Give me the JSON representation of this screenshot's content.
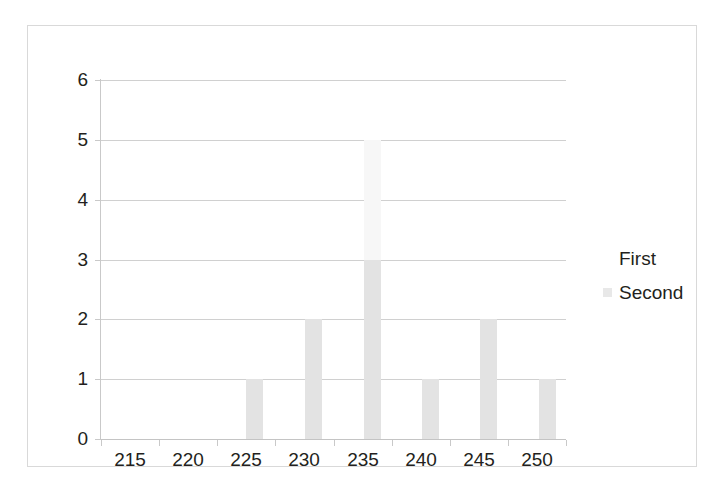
{
  "chart_data": {
    "type": "bar",
    "title": "",
    "subtitle": "",
    "xlabel": "",
    "ylabel": "",
    "xtick_labels": [
      "215",
      "220",
      "225",
      "230",
      "235",
      "240",
      "245",
      "250"
    ],
    "ytick_labels": [
      "0",
      "1",
      "2",
      "3",
      "4",
      "5",
      "6"
    ],
    "ylim": [
      0,
      6
    ],
    "xlim": [
      212.5,
      252.5
    ],
    "grid": true,
    "legend_position": "right",
    "legend": [
      {
        "name": "First",
        "color": "#f7f7f7"
      },
      {
        "name": "Second",
        "color": "#e3e3e3"
      }
    ],
    "categories": [
      226,
      231,
      236,
      241,
      246,
      251
    ],
    "series": [
      {
        "name": "First",
        "color": "#f7f7f7",
        "values": [
          0,
          0,
          5,
          0,
          0,
          0
        ]
      },
      {
        "name": "Second",
        "color": "#e3e3e3",
        "values": [
          1,
          2,
          3,
          1,
          2,
          1
        ]
      }
    ],
    "bars": [
      {
        "label": "226",
        "series": "Second",
        "value": 1,
        "left_px": 218,
        "width_px": 17
      },
      {
        "label": "231",
        "series": "Second",
        "value": 2,
        "left_px": 277,
        "width_px": 17
      },
      {
        "label": "236",
        "series": "First",
        "value": 5,
        "left_px": 336,
        "width_px": 17
      },
      {
        "label": "236",
        "series": "Second",
        "value": 3,
        "left_px": 336,
        "width_px": 17
      },
      {
        "label": "241",
        "series": "Second",
        "value": 1,
        "left_px": 394,
        "width_px": 17
      },
      {
        "label": "246",
        "series": "Second",
        "value": 2,
        "left_px": 452,
        "width_px": 17
      },
      {
        "label": "251",
        "series": "Second",
        "value": 1,
        "left_px": 511,
        "width_px": 17
      }
    ]
  },
  "colors": {
    "gridline": "#d0d0d0",
    "axis": "#c9c9c9",
    "frame": "#d9d9d9",
    "text": "#231f20",
    "background": "#ffffff"
  }
}
